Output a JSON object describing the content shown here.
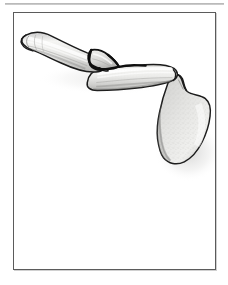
{
  "document": {
    "top_rule": "horizontal-divider-rule",
    "frame": {
      "border_color": "#5b5b5b",
      "background": "#ffffff"
    }
  },
  "figure": {
    "caption": "",
    "parts": [
      {
        "id": "sternal-end",
        "label": "Sternal (medial) end of clavicle"
      },
      {
        "id": "clavicle-shaft-medial",
        "label": "Medial clavicular shaft"
      },
      {
        "id": "butterfly-fragment",
        "label": "Butterfly (wedge) fracture fragment"
      },
      {
        "id": "fracture-line-proximal",
        "label": "Proximal fracture line"
      },
      {
        "id": "fracture-line-distal",
        "label": "Distal fracture line"
      },
      {
        "id": "clavicle-shaft-lateral",
        "label": "Lateral clavicular shaft"
      },
      {
        "id": "acromion",
        "label": "Acromion process"
      },
      {
        "id": "scapula-body",
        "label": "Scapula body"
      }
    ],
    "colors": {
      "outline": "#1b1b1b",
      "bone_light": "#f2f2f0",
      "bone_mid": "#d8d8d6",
      "bone_shadow": "#b3b3b1",
      "fracture_dark": "#111111",
      "stipple": "#9a9a98",
      "frame_border": "#5b5b5b",
      "rule": "#a9a9a9",
      "page_background": "#ffffff"
    }
  }
}
